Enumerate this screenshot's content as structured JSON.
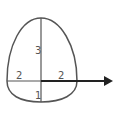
{
  "diagram": {
    "colors": {
      "stroke": "#555555",
      "arrow": "#222222",
      "label": "#555555",
      "background": "#ffffff"
    },
    "labels": {
      "top_semi_axis": "3",
      "left_semi_axis": "2",
      "right_semi_axis": "2",
      "bottom_semi_axis": "1"
    },
    "segments": {
      "top": 3,
      "left": 2,
      "right": 2,
      "bottom": 1
    }
  }
}
